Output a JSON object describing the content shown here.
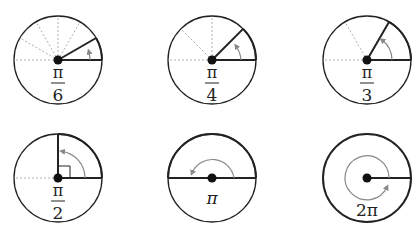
{
  "colors": {
    "stroke": "#222222",
    "arrow": "#888888",
    "dashed": "#999999"
  },
  "angles": [
    {
      "label_num": "π",
      "label_den": "6",
      "degrees": 30
    },
    {
      "label_num": "π",
      "label_den": "4",
      "degrees": 45
    },
    {
      "label_num": "π",
      "label_den": "3",
      "degrees": 60
    },
    {
      "label_num": "π",
      "label_den": "2",
      "degrees": 90
    },
    {
      "label": "π",
      "degrees": 180
    },
    {
      "label": "2π",
      "degrees": 360
    }
  ]
}
